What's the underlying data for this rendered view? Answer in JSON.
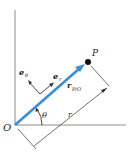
{
  "diagram": {
    "labels": {
      "origin": "O",
      "point": "P",
      "e_theta_base": "e",
      "e_theta_sub": "θ",
      "e_r_base": "e",
      "e_r_sub": "r",
      "r_vec_base": "r",
      "r_vec_sub": "P/O",
      "theta": "θ",
      "r_dim": "r"
    },
    "colors": {
      "vector": "#3a8fd6",
      "axes": "#8a8a8a",
      "lines": "#333333",
      "point": "#111111"
    }
  }
}
